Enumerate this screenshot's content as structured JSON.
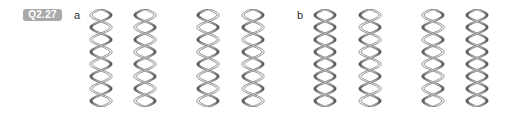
{
  "question_label": "Q2.27",
  "parts": [
    {
      "label": "a",
      "x": 74,
      "helices": [
        {
          "x": 88,
          "handedness": "right",
          "shade": "top"
        },
        {
          "x": 132,
          "handedness": "right",
          "shade": "alt"
        },
        {
          "x": 195,
          "handedness": "left",
          "shade": "top"
        },
        {
          "x": 240,
          "handedness": "left",
          "shade": "alt"
        }
      ]
    },
    {
      "label": "b",
      "x": 297,
      "helices": [
        {
          "x": 312,
          "handedness": "right",
          "shade": "dark"
        },
        {
          "x": 357,
          "handedness": "right",
          "shade": "alt"
        },
        {
          "x": 420,
          "handedness": "left",
          "shade": "alt"
        },
        {
          "x": 464,
          "handedness": "left",
          "shade": "dark"
        }
      ]
    }
  ],
  "colors": {
    "badge": "#a9a9a9",
    "ribbon_light": "#ffffff",
    "ribbon_dark": "#4a4a4a",
    "outline": "#555555"
  }
}
